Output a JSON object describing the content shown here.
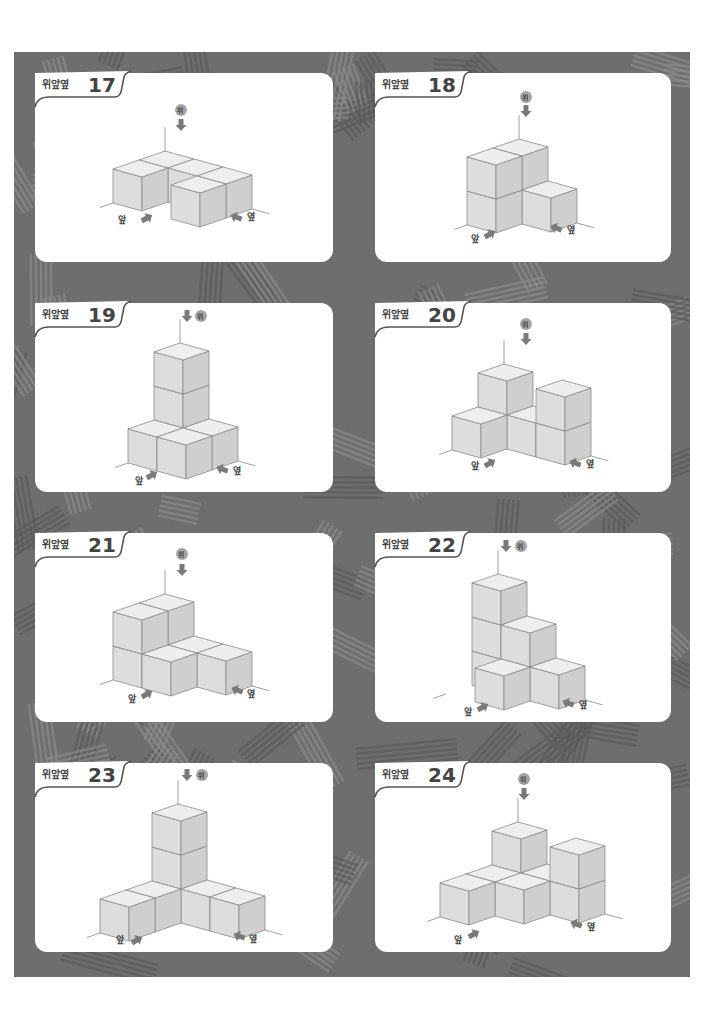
{
  "page": {
    "background_color": "#6e6e6e",
    "card_color": "#ffffff",
    "cube_colors": {
      "top": "#eeeeee",
      "left": "#dddddd",
      "right": "#cfcfcf",
      "edge": "#8a8a8a"
    }
  },
  "directions": {
    "top": "위",
    "front": "앞",
    "side": "옆"
  },
  "projection": {
    "A": [
      29,
      8
    ],
    "B": [
      26,
      -9
    ],
    "V": [
      0,
      -34
    ]
  },
  "puzzles": [
    {
      "label": "위앞옆",
      "number": "17",
      "card": [
        35,
        73,
        298,
        189
      ],
      "origin": [
        113,
        203
      ],
      "voxels": [
        [
          0,
          0,
          0
        ],
        [
          2,
          0,
          0
        ],
        [
          0,
          1,
          0
        ],
        [
          1,
          1,
          0
        ],
        [
          2,
          1,
          0
        ]
      ],
      "top_arrow": {
        "badge": [
          181,
          110
        ],
        "arrow": [
          181,
          125
        ],
        "badge_first": true
      },
      "front_label": {
        "text_pos": [
          118,
          215
        ],
        "arrow": [
          147,
          218
        ]
      },
      "side_label": {
        "text_pos": [
          247,
          212
        ],
        "arrow": [
          236,
          217
        ]
      }
    },
    {
      "label": "위앞옆",
      "number": "18",
      "card": [
        375,
        73,
        296,
        189
      ],
      "origin": [
        467,
        225
      ],
      "voxels": [
        [
          0,
          0,
          0
        ],
        [
          0,
          0,
          1
        ],
        [
          0,
          1,
          0
        ],
        [
          0,
          1,
          1
        ],
        [
          1,
          1,
          0
        ]
      ],
      "top_arrow": {
        "badge": [
          526,
          97
        ],
        "arrow": [
          526,
          111
        ],
        "badge_first": true
      },
      "front_label": {
        "text_pos": [
          471,
          234
        ],
        "arrow": [
          490,
          234
        ]
      },
      "side_label": {
        "text_pos": [
          567,
          225
        ],
        "arrow": [
          556,
          228
        ]
      }
    },
    {
      "label": "위앞옆",
      "number": "19",
      "card": [
        35,
        303,
        298,
        189
      ],
      "origin": [
        128,
        463
      ],
      "voxels": [
        [
          0,
          0,
          0
        ],
        [
          1,
          0,
          0
        ],
        [
          0,
          1,
          0
        ],
        [
          1,
          1,
          0
        ],
        [
          0,
          1,
          1
        ],
        [
          0,
          1,
          2
        ]
      ],
      "top_arrow": {
        "badge": [
          201,
          316
        ],
        "arrow": [
          187,
          316
        ],
        "badge_first": false
      },
      "front_label": {
        "text_pos": [
          135,
          476
        ],
        "arrow": [
          152,
          475
        ]
      },
      "side_label": {
        "text_pos": [
          233,
          466
        ],
        "arrow": [
          222,
          469
        ]
      }
    },
    {
      "label": "위앞옆",
      "number": "20",
      "card": [
        375,
        303,
        296,
        189
      ],
      "origin": [
        452,
        450
      ],
      "voxels": [
        [
          0,
          0,
          0
        ],
        [
          0,
          1,
          0
        ],
        [
          0,
          1,
          1
        ],
        [
          1,
          1,
          0
        ],
        [
          2,
          1,
          0
        ],
        [
          2,
          1,
          1
        ]
      ],
      "top_arrow": {
        "badge": [
          526,
          324
        ],
        "arrow": [
          526,
          339
        ],
        "badge_first": true
      },
      "front_label": {
        "text_pos": [
          471,
          461
        ],
        "arrow": [
          490,
          463
        ]
      },
      "side_label": {
        "text_pos": [
          586,
          459
        ],
        "arrow": [
          575,
          463
        ]
      }
    },
    {
      "label": "위앞옆",
      "number": "21",
      "card": [
        35,
        533,
        298,
        189
      ],
      "origin": [
        113,
        680
      ],
      "voxels": [
        [
          0,
          0,
          0
        ],
        [
          0,
          0,
          1
        ],
        [
          0,
          1,
          0
        ],
        [
          0,
          1,
          1
        ],
        [
          1,
          0,
          0
        ],
        [
          1,
          1,
          0
        ],
        [
          2,
          1,
          0
        ]
      ],
      "top_arrow": {
        "badge": [
          182,
          554
        ],
        "arrow": [
          182,
          570
        ],
        "badge_first": true
      },
      "front_label": {
        "text_pos": [
          128,
          694
        ],
        "arrow": [
          147,
          694
        ]
      },
      "side_label": {
        "text_pos": [
          247,
          689
        ],
        "arrow": [
          237,
          690
        ]
      }
    },
    {
      "label": "위앞옆",
      "number": "22",
      "card": [
        375,
        533,
        296,
        189
      ],
      "origin": [
        446,
        694
      ],
      "voxels": [
        [
          0,
          1,
          0
        ],
        [
          0,
          1,
          1
        ],
        [
          0,
          1,
          2
        ],
        [
          1,
          1,
          0
        ],
        [
          1,
          1,
          1
        ],
        [
          2,
          1,
          0
        ],
        [
          1,
          0,
          0
        ]
      ],
      "top_arrow": {
        "badge": [
          521,
          546
        ],
        "arrow": [
          506,
          546
        ],
        "badge_first": false
      },
      "front_label": {
        "text_pos": [
          464,
          707
        ],
        "arrow": [
          483,
          707
        ]
      },
      "side_label": {
        "text_pos": [
          579,
          700
        ],
        "arrow": [
          568,
          703
        ]
      }
    },
    {
      "label": "위앞옆",
      "number": "23",
      "card": [
        35,
        763,
        298,
        189
      ],
      "origin": [
        100,
        933
      ],
      "voxels": [
        [
          0,
          0,
          0
        ],
        [
          0,
          1,
          0
        ],
        [
          0,
          2,
          0
        ],
        [
          0,
          2,
          1
        ],
        [
          0,
          2,
          2
        ],
        [
          1,
          2,
          0
        ],
        [
          2,
          2,
          0
        ]
      ],
      "top_arrow": {
        "badge": [
          202,
          775
        ],
        "arrow": [
          187,
          775
        ],
        "badge_first": false
      },
      "front_label": {
        "text_pos": [
          116,
          935
        ],
        "arrow": [
          137,
          940
        ]
      },
      "side_label": {
        "text_pos": [
          249,
          934
        ],
        "arrow": [
          239,
          936
        ]
      }
    },
    {
      "label": "위앞옆",
      "number": "24",
      "card": [
        375,
        763,
        296,
        189
      ],
      "origin": [
        440,
        917
      ],
      "voxels": [
        [
          0,
          0,
          0
        ],
        [
          0,
          1,
          0
        ],
        [
          0,
          2,
          0
        ],
        [
          0,
          2,
          1
        ],
        [
          1,
          1,
          0
        ],
        [
          1,
          2,
          0
        ],
        [
          2,
          2,
          0
        ],
        [
          2,
          2,
          1
        ]
      ],
      "top_arrow": {
        "badge": [
          524,
          779
        ],
        "arrow": [
          524,
          794
        ],
        "badge_first": true
      },
      "front_label": {
        "text_pos": [
          454,
          935
        ],
        "arrow": [
          474,
          934
        ]
      },
      "side_label": {
        "text_pos": [
          587,
          922
        ],
        "arrow": [
          576,
          924
        ]
      }
    }
  ]
}
